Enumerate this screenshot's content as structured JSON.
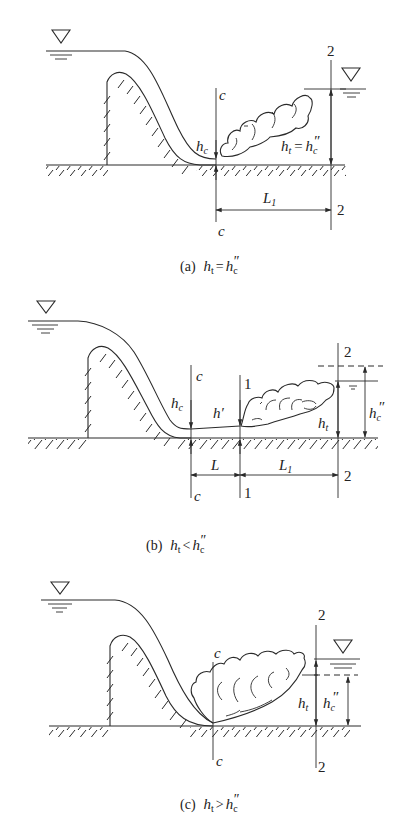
{
  "figure": {
    "panels": [
      {
        "id": "a",
        "caption_prefix": "(a)",
        "caption_lhs": "h",
        "caption_lhs_sub": "t",
        "caption_op": "=",
        "caption_rhs": "h",
        "caption_rhs_sub": "c",
        "caption_rhs_prime": "″",
        "labels": {
          "section_c_top": "c",
          "section_c_bottom": "c",
          "section_2_top": "2",
          "section_2_bottom": "2",
          "hc": "h",
          "hc_sub": "c",
          "ht_eq": "h",
          "ht_eq_sub": "t",
          "ht_eq_op": "=",
          "ht_eq_rhs": "h",
          "ht_eq_rhs_sub": "c",
          "ht_eq_rhs_prime": "″",
          "L1": "L",
          "L1_sub": "1"
        }
      },
      {
        "id": "b",
        "caption_prefix": "(b)",
        "caption_lhs": "h",
        "caption_lhs_sub": "t",
        "caption_op": "<",
        "caption_rhs": "h",
        "caption_rhs_sub": "c",
        "caption_rhs_prime": "″",
        "labels": {
          "section_c_top": "c",
          "section_c_bottom": "c",
          "section_1_top": "1",
          "section_1_bottom": "1",
          "section_2_top": "2",
          "section_2_bottom": "2",
          "hc": "h",
          "hc_sub": "c",
          "h_prime": "h′",
          "ht": "h",
          "ht_sub": "t",
          "hc2": "h",
          "hc2_sub": "c",
          "hc2_prime": "″",
          "L": "L",
          "L1": "L",
          "L1_sub": "1"
        }
      },
      {
        "id": "c",
        "caption_prefix": "(c)",
        "caption_lhs": "h",
        "caption_lhs_sub": "t",
        "caption_op": ">",
        "caption_rhs": "h",
        "caption_rhs_sub": "c",
        "caption_rhs_prime": "″",
        "labels": {
          "section_c_top": "c",
          "section_c_bottom": "c",
          "section_2_top": "2",
          "section_2_bottom": "2",
          "ht": "h",
          "ht_sub": "t",
          "hc2": "h",
          "hc2_sub": "c",
          "hc2_prime": "″"
        }
      }
    ]
  }
}
